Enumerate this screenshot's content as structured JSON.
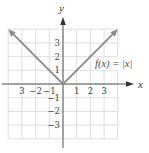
{
  "chart_data": {
    "type": "line",
    "title": "",
    "xlabel": "x",
    "ylabel": "y",
    "xlim": [
      -4,
      4
    ],
    "ylim": [
      -4,
      4
    ],
    "grid": true,
    "x_ticks": [
      {
        "value": -3,
        "label": "3"
      },
      {
        "value": -2,
        "label": "−2"
      },
      {
        "value": -1,
        "label": "−1"
      },
      {
        "value": 1,
        "label": "1"
      },
      {
        "value": 2,
        "label": "2"
      },
      {
        "value": 3,
        "label": "3"
      }
    ],
    "y_ticks": [
      {
        "value": 3,
        "label": "3"
      },
      {
        "value": 2,
        "label": "2"
      },
      {
        "value": 1,
        "label": "1"
      },
      {
        "value": -1,
        "label": "−1"
      },
      {
        "value": -2,
        "label": "−2"
      },
      {
        "value": -3,
        "label": "−3"
      }
    ],
    "series": [
      {
        "name": "f(x) = |x|",
        "x": [
          -4,
          -3,
          -2,
          -1,
          0,
          1,
          2,
          3,
          4
        ],
        "y": [
          4,
          3,
          2,
          1,
          0,
          1,
          2,
          3,
          4
        ],
        "arrows_at_ends": true
      }
    ],
    "annotations": [
      {
        "text": "f(x) = |x|",
        "x": 2.4,
        "y": 1.35
      }
    ],
    "legend": "none"
  },
  "style": {
    "grid_color": "#d6d6d6",
    "axis_color": "#555555",
    "line_color": "#8a8a8a",
    "text_color": "#3a3a3a"
  },
  "labels": {
    "x_axis": "x",
    "y_axis": "y",
    "function": "f(x) = |x|"
  }
}
